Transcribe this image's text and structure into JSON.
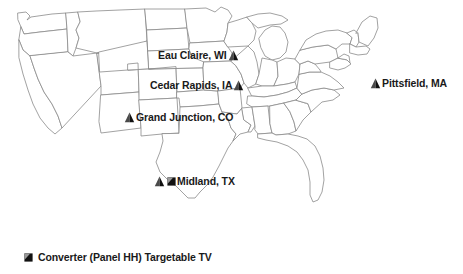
{
  "figure": {
    "type": "map",
    "region": "United States (contiguous 48 states)",
    "background_color": "#ffffff",
    "state_outline_color": "#8a8a8a",
    "marker_color": "#1a1a1a",
    "label_color": "#1a1a1a"
  },
  "markers": [
    {
      "id": "eau-claire-wi",
      "label": "Eau Claire, WI",
      "icon": "triangle-marker-icon",
      "label_side": "left",
      "x": 246,
      "y": 55
    },
    {
      "id": "cedar-rapids-ia",
      "label": "Cedar Rapids, IA",
      "icon": "triangle-marker-icon",
      "label_side": "left",
      "x": 250,
      "y": 85
    },
    {
      "id": "grand-junction-co",
      "label": "Grand Junction, CO",
      "icon": "triangle-marker-icon",
      "label_side": "right",
      "x": 128,
      "y": 117
    },
    {
      "id": "midland-tx",
      "label": "Midland, TX",
      "icon": "triangle-marker-icon",
      "secondary_icon": "converter-marker-icon",
      "label_side": "right",
      "x": 158,
      "y": 181
    },
    {
      "id": "pittsfield-ma",
      "label": "Pittsfield, MA",
      "icon": "triangle-marker-icon",
      "label_side": "right",
      "x": 374,
      "y": 83
    }
  ],
  "legend": {
    "icon": "converter-marker-icon",
    "text": "Converter (Panel HH) Targetable TV"
  }
}
